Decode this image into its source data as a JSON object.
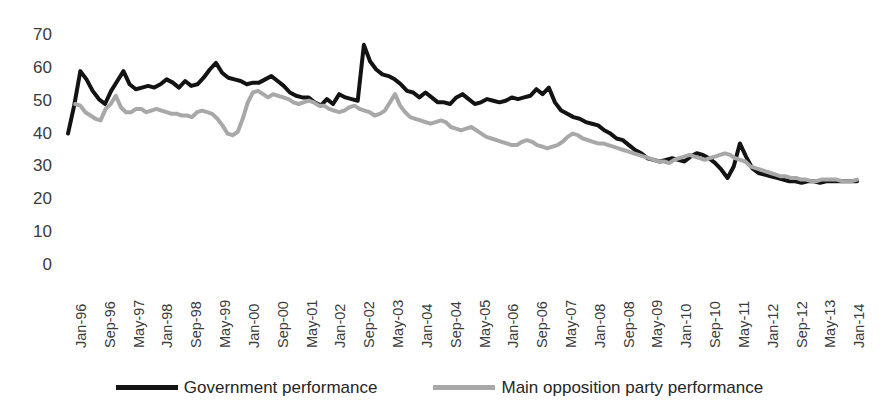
{
  "chart_data": {
    "type": "line",
    "title": "",
    "subtitle": "",
    "xlabel": "",
    "ylabel": "",
    "ylim": [
      0,
      70
    ],
    "xlim": [
      0,
      219
    ],
    "grid": false,
    "legend_position": "bottom",
    "y_ticks": [
      0,
      10,
      20,
      30,
      40,
      50,
      60,
      70
    ],
    "x_tick_labels": [
      "Jan-96",
      "Sep-96",
      "May-97",
      "Jan-98",
      "Sep-98",
      "May-99",
      "Jan-00",
      "Sep-00",
      "May-01",
      "Jan-02",
      "Sep-02",
      "May-03",
      "Jan-04",
      "Sep-04",
      "May-05",
      "Jan-06",
      "Sep-06",
      "May-07",
      "Jan-08",
      "Sep-08",
      "May-09",
      "Jan-10",
      "Sep-10",
      "May-11",
      "Jan-12",
      "Sep-12",
      "May-13",
      "Jan-14"
    ],
    "x_tick_indices": [
      0,
      8,
      16,
      24,
      32,
      40,
      48,
      56,
      64,
      72,
      80,
      88,
      96,
      104,
      112,
      120,
      128,
      136,
      144,
      152,
      160,
      168,
      176,
      184,
      192,
      200,
      208,
      216
    ],
    "series": [
      {
        "name": "Government performance",
        "color": "#131313",
        "width": 4.0,
        "x_start": 0,
        "values": [
          40,
          48.5,
          59,
          56.5,
          53,
          50.5,
          49,
          53,
          56,
          59,
          55,
          53.5,
          54,
          54.5,
          54,
          55,
          56.5,
          55.5,
          54,
          56,
          54.5,
          55,
          57,
          59.5,
          61.5,
          58.5,
          57,
          56.5,
          56,
          55,
          55.5,
          55.5,
          56.5,
          57.5,
          56,
          54.5,
          52.5,
          51.5,
          51,
          51,
          49.5,
          48.5,
          50.5,
          49,
          52,
          51,
          50.5,
          50,
          67,
          62,
          59.5,
          58,
          57.5,
          56.5,
          55,
          53,
          52.5,
          51,
          52.5,
          51,
          49.5,
          49.5,
          49,
          51,
          52,
          50.5,
          49,
          49.5,
          50.5,
          50,
          49.5,
          50,
          51,
          50.5,
          51,
          51.5,
          53.5,
          52,
          54,
          49.5,
          47,
          46,
          45,
          44.5,
          43.5,
          43,
          42.5,
          41,
          40,
          38.5,
          38,
          36.5,
          35,
          34,
          32.5,
          32,
          31.5,
          32,
          32.5,
          32,
          31.5,
          33,
          34,
          33.5,
          32.5,
          31,
          29,
          26.5,
          30,
          37,
          33,
          29.5,
          28,
          27.5,
          27,
          26.5,
          26,
          25.5,
          25.5,
          25,
          25.5,
          25.5,
          25,
          25.5,
          25.5,
          25.5,
          25.5,
          25.5,
          25.5
        ]
      },
      {
        "name": "Main opposition party performance",
        "color": "#a8a8a8",
        "width": 4.0,
        "x_start": 2,
        "values": [
          49,
          48.5,
          46.5,
          45.5,
          44.5,
          44,
          47.5,
          49,
          51.5,
          48,
          46.5,
          46.5,
          47.5,
          47.5,
          46.5,
          47,
          47.5,
          47,
          46.5,
          46,
          46,
          45.5,
          45.5,
          45,
          46.5,
          47,
          46.5,
          46,
          44.5,
          42.5,
          40,
          39.5,
          40.5,
          44.5,
          49.5,
          52.5,
          53,
          52,
          51,
          52,
          51.5,
          51,
          50.5,
          49.5,
          49,
          49.5,
          50,
          49.5,
          48.5,
          48.5,
          47.5,
          47,
          46.5,
          47,
          48,
          48.5,
          47.5,
          47,
          46.5,
          45.5,
          46,
          47,
          49.5,
          52,
          48.5,
          46.5,
          45,
          44.5,
          44,
          43.5,
          43,
          43.5,
          44,
          43.5,
          42,
          41.5,
          41,
          41.5,
          42,
          41,
          40,
          39,
          38.5,
          38,
          37.5,
          37,
          36.5,
          36.5,
          37.5,
          38,
          37.5,
          36.5,
          36,
          35.5,
          36,
          36.5,
          37.5,
          39,
          40,
          39.5,
          38.5,
          38,
          37.5,
          37,
          37,
          36.5,
          36,
          35.5,
          35,
          34.5,
          34,
          33.5,
          33,
          32.5,
          32,
          31.5,
          31.5,
          31,
          32,
          32.5,
          33,
          33.5,
          33,
          32.5,
          32,
          32.5,
          33,
          33.5,
          34,
          33.5,
          32.5,
          32,
          31.5,
          30,
          29.5,
          29,
          28.5,
          28,
          27.5,
          27,
          27,
          26.5,
          26.5,
          26,
          26,
          25.5,
          25.5,
          26,
          26,
          26,
          26,
          25.5,
          25.5,
          25.5,
          26
        ]
      }
    ]
  },
  "legend": {
    "entries": [
      {
        "label": "Government performance",
        "color": "#131313"
      },
      {
        "label": "Main opposition party performance",
        "color": "#a8a8a8"
      }
    ]
  }
}
